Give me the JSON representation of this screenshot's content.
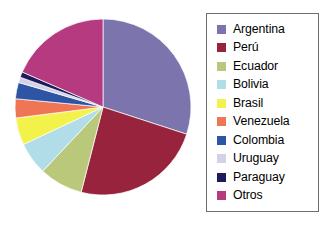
{
  "chart_data": {
    "type": "pie",
    "title": "",
    "subtitle": "",
    "xlabel": "",
    "ylabel": "",
    "grid": false,
    "legend_position": "right",
    "start_angle_deg": 0,
    "direction": "clockwise",
    "categories": [
      "Argentina",
      "Perú",
      "Ecuador",
      "Bolivia",
      "Brasil",
      "Venezuela",
      "Colombia",
      "Uruguay",
      "Paraguay",
      "Otros"
    ],
    "values": [
      30.0,
      24.0,
      8.0,
      6.0,
      5.0,
      3.5,
      3.0,
      1.0,
      1.0,
      18.5
    ],
    "colors": [
      "#7b74ad",
      "#98233c",
      "#b9c87b",
      "#b0dde8",
      "#f2f24a",
      "#ef7655",
      "#2d55a4",
      "#d4d2e6",
      "#1b1b5e",
      "#b53a80"
    ],
    "slices": [
      {
        "label": "Argentina",
        "value": 30.0,
        "color": "#7b74ad"
      },
      {
        "label": "Perú",
        "value": 24.0,
        "color": "#98233c"
      },
      {
        "label": "Ecuador",
        "value": 8.0,
        "color": "#b9c87b"
      },
      {
        "label": "Bolivia",
        "value": 6.0,
        "color": "#b0dde8"
      },
      {
        "label": "Brasil",
        "value": 5.0,
        "color": "#f2f24a"
      },
      {
        "label": "Venezuela",
        "value": 3.5,
        "color": "#ef7655"
      },
      {
        "label": "Colombia",
        "value": 3.0,
        "color": "#2d55a4"
      },
      {
        "label": "Uruguay",
        "value": 1.0,
        "color": "#d4d2e6"
      },
      {
        "label": "Paraguay",
        "value": 1.0,
        "color": "#1b1b5e"
      },
      {
        "label": "Otros",
        "value": 18.5,
        "color": "#b53a80"
      }
    ]
  },
  "legend": {
    "items": [
      {
        "label": "Argentina",
        "color": "#7b74ad"
      },
      {
        "label": "Perú",
        "color": "#98233c"
      },
      {
        "label": "Ecuador",
        "color": "#b9c87b"
      },
      {
        "label": "Bolivia",
        "color": "#b0dde8"
      },
      {
        "label": "Brasil",
        "color": "#f2f24a"
      },
      {
        "label": "Venezuela",
        "color": "#ef7655"
      },
      {
        "label": "Colombia",
        "color": "#2d55a4"
      },
      {
        "label": "Uruguay",
        "color": "#d4d2e6"
      },
      {
        "label": "Paraguay",
        "color": "#1b1b5e"
      },
      {
        "label": "Otros",
        "color": "#b53a80"
      }
    ]
  }
}
